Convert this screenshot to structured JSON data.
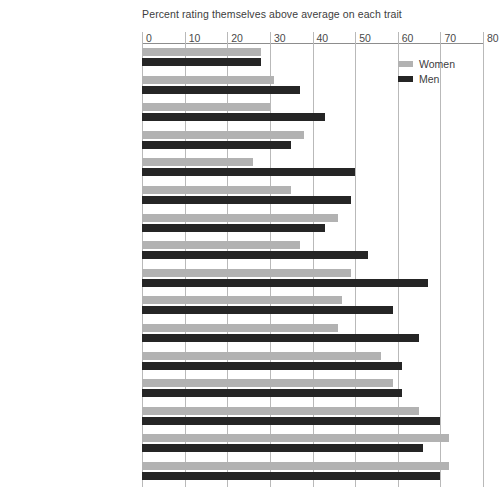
{
  "chart_data": {
    "type": "bar",
    "orientation": "horizontal",
    "title": "Percent rating themselves above average on each trait",
    "xlabel": "",
    "ylabel": "",
    "xlim": [
      0,
      80
    ],
    "xticks": [
      0,
      10,
      20,
      30,
      40,
      50,
      60,
      70,
      80
    ],
    "grid": true,
    "legend_position": "top-right",
    "categories": [
      "Artistic ability",
      "Public speaking ability",
      "Popularity",
      "Spirituality",
      "Computer skills",
      "Risk taking",
      "Writing ability",
      "Mathematical ability",
      "Self-confidence",
      "Emotional health",
      "Physical health",
      "Leadership ability",
      "Understanding of others",
      "Academic ability",
      "Drive to achieve",
      "Cooperativeness"
    ],
    "series": [
      {
        "name": "Women",
        "color": "#b2b2b2",
        "values": [
          28,
          31,
          30,
          38,
          26,
          35,
          46,
          37,
          49,
          47,
          46,
          56,
          59,
          65,
          72,
          72
        ]
      },
      {
        "name": "Men",
        "color": "#252525",
        "values": [
          28,
          37,
          43,
          35,
          50,
          49,
          43,
          53,
          67,
          59,
          65,
          61,
          61,
          70,
          66,
          70
        ]
      }
    ]
  },
  "legend": {
    "items": [
      {
        "label": "Women",
        "color": "#b2b2b2"
      },
      {
        "label": "Men",
        "color": "#252525"
      }
    ]
  }
}
